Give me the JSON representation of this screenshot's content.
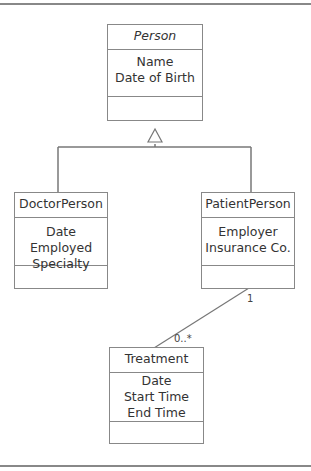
{
  "classes": {
    "person": {
      "name": "Person",
      "abstract": true,
      "attributes": [
        "Name",
        "Date of Birth"
      ]
    },
    "doctor": {
      "name": "DoctorPerson",
      "attributes": [
        "Date Employed",
        "Specialty"
      ]
    },
    "patient": {
      "name": "PatientPerson",
      "attributes": [
        "Employer",
        "Insurance Co."
      ]
    },
    "treatment": {
      "name": "Treatment",
      "attributes": [
        "Date",
        "Start Time",
        "End Time"
      ]
    }
  },
  "associations": {
    "patient_treatment": {
      "patient_end": "1",
      "treatment_end": "0..*"
    }
  }
}
